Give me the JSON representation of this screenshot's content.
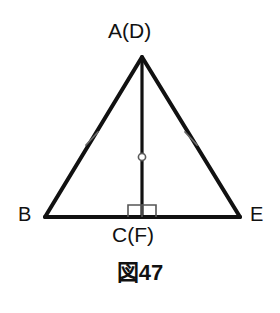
{
  "figure": {
    "caption": "図47",
    "background_color": "#ffffff",
    "stroke_color": "#111111",
    "labels": {
      "apex": "A(D)",
      "base_left": "B",
      "base_right": "E",
      "altitude_foot": "C(F)"
    },
    "markers": {
      "right_angle": "right-angle-square",
      "midpoint": "circle-marker",
      "congruence_left": "single-tick",
      "congruence_right": "single-tick"
    },
    "geometry": {
      "apex_point": "142,57",
      "base_left_point": "45,217",
      "base_right_point": "240,217",
      "altitude_foot_point": "142,217"
    }
  }
}
